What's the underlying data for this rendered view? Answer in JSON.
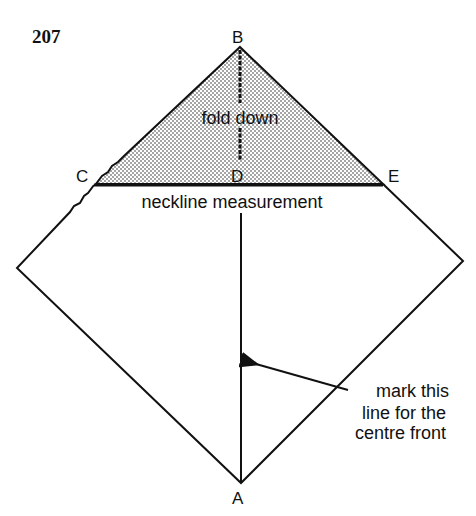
{
  "figure": {
    "number": "207",
    "points": {
      "A": "A",
      "B": "B",
      "C": "C",
      "D": "D",
      "E": "E"
    },
    "labels": {
      "fold": "fold down",
      "neckline": "neckline measurement",
      "mark_line1": "mark this",
      "mark_line2": "line for the",
      "mark_line3": "centre front"
    },
    "colors": {
      "ink": "#111111",
      "background": "#ffffff"
    }
  }
}
